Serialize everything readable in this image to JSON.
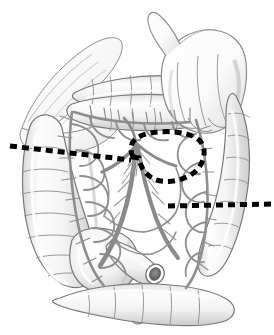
{
  "figure": {
    "background_color": "#ffffff",
    "width": 274,
    "height": 335,
    "style": "grayscale medical line illustration with airbrush shading",
    "caption": ""
  },
  "palette": {
    "background": "#ffffff",
    "outline": "#6e6e6e",
    "outline_dark": "#4a4a4a",
    "bowel_fill_light": "#fbfbfb",
    "bowel_fill_mid": "#ededed",
    "bowel_shadow": "#d6d6d6",
    "vessel_stroke": "#8a8a8a",
    "vessel_fill": "#9a9a9a",
    "mesentery_fill": "#ffffff",
    "hand_fill": "#fdfdfd",
    "hand_shadow": "#dcdcdc",
    "dashed_line": "#000000"
  },
  "structures": [
    {
      "id": "greater-omentum",
      "label": "Greater omentum",
      "region": "upper-left"
    },
    {
      "id": "transverse-colon",
      "label": "Transverse colon",
      "region": "top-center"
    },
    {
      "id": "surgeon-hand",
      "label": "Surgeon's hand retracting",
      "region": "upper-right"
    },
    {
      "id": "ascending-colon",
      "label": "Ascending colon",
      "region": "left"
    },
    {
      "id": "cecum",
      "label": "Cecum",
      "region": "lower-center-left"
    },
    {
      "id": "appendix",
      "label": "Vermiform appendix",
      "region": "lower-center"
    },
    {
      "id": "terminal-ileum",
      "label": "Cut end of terminal ileum",
      "region": "lower-center"
    },
    {
      "id": "descending-colon",
      "label": "Descending colon",
      "region": "right"
    },
    {
      "id": "sigmoid-colon",
      "label": "Sigmoid colon",
      "region": "bottom-right"
    },
    {
      "id": "mesentery",
      "label": "Mesentery",
      "region": "center"
    },
    {
      "id": "sma-trunk",
      "label": "Superior mesenteric artery trunk",
      "region": "center"
    },
    {
      "id": "marginal-arcade",
      "label": "Marginal artery arcade",
      "region": "center"
    }
  ],
  "annotations": {
    "resection_lines": [
      {
        "id": "proximal-resection-line",
        "label": "Proximal bowel resection line",
        "style": "dashed",
        "color": "#000000",
        "dash_length": 7,
        "dash_gap": 5,
        "stroke_width": 5,
        "from": {
          "x": 10,
          "y": 146
        },
        "to": {
          "x": 131,
          "y": 160
        }
      },
      {
        "id": "distal-resection-line",
        "label": "Distal bowel resection line",
        "style": "dashed",
        "color": "#000000",
        "dash_length": 7,
        "dash_gap": 5,
        "stroke_width": 5,
        "from": {
          "x": 168,
          "y": 206
        },
        "to": {
          "x": 272,
          "y": 204
        }
      },
      {
        "id": "mesenteric-pedicle-loop",
        "label": "Mesenteric/vascular pedicle division line",
        "style": "dashed-closed-loop",
        "color": "#000000",
        "dash_length": 7,
        "dash_gap": 5,
        "stroke_width": 5
      }
    ]
  },
  "chart_data": {
    "type": "diagram",
    "elements": 12
  }
}
